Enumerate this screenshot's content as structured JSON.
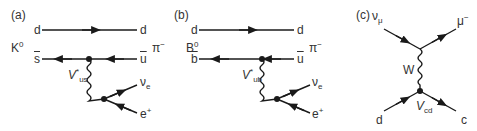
{
  "panels": [
    {
      "id": "a",
      "label": "(a)",
      "meson": {
        "name": "K",
        "sup": "0"
      },
      "final_meson": {
        "name": "π",
        "sup": "−"
      },
      "top_line": {
        "left": "d",
        "right": "d"
      },
      "bottom_line": {
        "left": "s",
        "right": "u"
      },
      "coupling": {
        "name": "V",
        "sup": "*",
        "sub": "us"
      },
      "leptons": {
        "neutrino": "ν",
        "neutrino_sub": "e",
        "lepton": "e",
        "lepton_sup": "+"
      }
    },
    {
      "id": "b",
      "label": "(b)",
      "meson": {
        "name": "B",
        "sup": "0"
      },
      "final_meson": {
        "name": "π",
        "sup": "−"
      },
      "top_line": {
        "left": "d",
        "right": "d"
      },
      "bottom_line": {
        "left": "b",
        "right": "u"
      },
      "coupling": {
        "name": "V",
        "sup": "*",
        "sub": "ub"
      },
      "leptons": {
        "neutrino": "ν",
        "neutrino_sub": "e",
        "lepton": "e",
        "lepton_sup": "+"
      }
    },
    {
      "id": "c",
      "label": "(c)",
      "incoming_top": {
        "name": "ν",
        "sub": "μ"
      },
      "outgoing_top": {
        "name": "μ",
        "sup": "−"
      },
      "boson": "W",
      "incoming_bottom": "d",
      "outgoing_bottom": "c",
      "coupling": {
        "name": "V",
        "sub": "cd"
      }
    }
  ],
  "colors": {
    "line": "#1a1a1a",
    "text": "#333333",
    "background": "#ffffff"
  }
}
